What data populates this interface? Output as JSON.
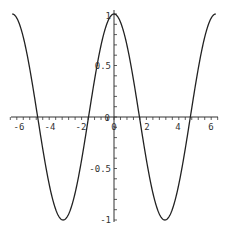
{
  "chart_data": {
    "type": "line",
    "title": "",
    "xlabel": "",
    "ylabel": "",
    "function": "cos(x)",
    "xlim": [
      -6.2832,
      6.2832
    ],
    "ylim": [
      -1,
      1
    ],
    "grid": false,
    "legend": null,
    "axes_style": "crossing at origin",
    "x_ticks": [
      -6,
      -4,
      -2,
      0,
      2,
      4,
      6
    ],
    "x_tick_labels": [
      "-6",
      "-4",
      "-2",
      "0",
      "2",
      "4",
      "6"
    ],
    "y_ticks": [
      -1,
      -0.5,
      0.5,
      1
    ],
    "y_tick_labels": [
      "-1",
      "-0.5",
      "0.5",
      "1"
    ],
    "series": [
      {
        "name": "cos(x)",
        "color": "#222222",
        "x": [
          -6.28,
          -5.5,
          -4.71,
          -3.93,
          -3.14,
          -2.36,
          -1.57,
          -0.79,
          0,
          0.79,
          1.57,
          2.36,
          3.14,
          3.93,
          4.71,
          5.5,
          6.28
        ],
        "y": [
          1,
          0.71,
          0,
          -0.71,
          -1,
          -0.71,
          0,
          0.71,
          1,
          0.71,
          0,
          -0.71,
          -1,
          -0.71,
          0,
          0.71,
          1
        ]
      }
    ]
  },
  "labels": {
    "x": [
      "-6",
      "-4",
      "-2",
      "0",
      "2",
      "4",
      "6"
    ],
    "y_pos": "0.5",
    "y_one": "1",
    "y_neg_half": "-0.5",
    "y_neg_one": "-1",
    "origin": "0"
  }
}
